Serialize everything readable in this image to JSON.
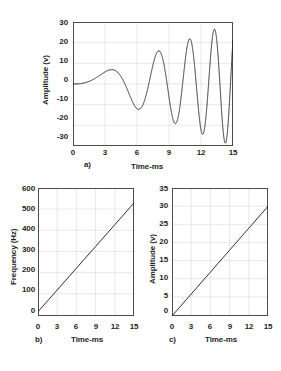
{
  "figure": {
    "background_color": "#ffffff",
    "line_color": "#1a1a1a",
    "frame_color": "#4d4d4d",
    "grid_color": "#d9d9d9"
  },
  "panels": {
    "a": {
      "label": "a)",
      "xlabel": "Time-ms",
      "ylabel": "Amplitude (v)",
      "xticks": [
        "0",
        "3",
        "6",
        "9",
        "12",
        "15"
      ],
      "yticks": [
        "-30",
        "-20",
        "-10",
        "0",
        "10",
        "20",
        "30"
      ]
    },
    "b": {
      "label": "b)",
      "xlabel": "Time-ms",
      "ylabel": "Frequency (Hz)",
      "xticks": [
        "0",
        "3",
        "6",
        "9",
        "12",
        "15"
      ],
      "yticks": [
        "0",
        "100",
        "200",
        "300",
        "400",
        "500",
        "600"
      ]
    },
    "c": {
      "label": "c)",
      "xlabel": "Time-ms",
      "ylabel": "Amplitude (v)",
      "xticks": [
        "0",
        "3",
        "6",
        "9",
        "12",
        "15"
      ],
      "yticks": [
        "0",
        "5",
        "10",
        "15",
        "20",
        "25",
        "30",
        "35"
      ]
    }
  },
  "chart_data": [
    {
      "id": "a",
      "type": "line",
      "title": "",
      "panel_label": "a)",
      "xlabel": "Time-ms",
      "ylabel": "Amplitude (v)",
      "xlim": [
        0,
        15
      ],
      "ylim": [
        -30,
        30
      ],
      "xticks": [
        0,
        3,
        6,
        9,
        12,
        15
      ],
      "yticks": [
        -30,
        -20,
        -10,
        0,
        10,
        20,
        30
      ],
      "grid": true,
      "legend": "none",
      "description": "Amplitude-modulated linear chirp: amplitude grows linearly 0 to 30 V while instantaneous frequency sweeps linearly 20 to 530 Hz over 15 ms.",
      "model": {
        "waveform": "A(t)*sin(2*pi*(f0*t + 0.5*k*t^2))",
        "amplitude_slope_v_per_ms": 2.0,
        "f0_hz": 20,
        "f1_hz": 530,
        "duration_ms": 15,
        "phase_offset_rad": 0
      },
      "envelope": {
        "t_ms": [
          0,
          3,
          6,
          9,
          12,
          15
        ],
        "upper_v": [
          0,
          6,
          12,
          18,
          24,
          30
        ],
        "lower_v": [
          0,
          -6,
          -12,
          -18,
          -24,
          -30
        ]
      },
      "peaks": {
        "t_ms": [
          2.6,
          5.6,
          7.6,
          9.2,
          10.6,
          11.8,
          13.0,
          14.1,
          15.0
        ],
        "value_v": [
          5,
          10.5,
          13.7,
          16.5,
          19.5,
          22,
          24.5,
          26.5,
          29.5
        ]
      },
      "troughs": {
        "t_ms": [
          4.4,
          6.7,
          8.5,
          9.9,
          11.2,
          12.4,
          13.6,
          14.6
        ],
        "value_v": [
          -9,
          -13,
          -16,
          -19,
          -21.5,
          -24,
          -26,
          -28.5
        ]
      }
    },
    {
      "id": "b",
      "type": "line",
      "title": "",
      "panel_label": "b)",
      "xlabel": "Time-ms",
      "ylabel": "Frequency (Hz)",
      "xlim": [
        0,
        15
      ],
      "ylim": [
        0,
        600
      ],
      "xticks": [
        0,
        3,
        6,
        9,
        12,
        15
      ],
      "yticks": [
        0,
        100,
        200,
        300,
        400,
        500,
        600
      ],
      "grid": true,
      "legend": "none",
      "x": [
        0,
        3,
        6,
        9,
        12,
        15
      ],
      "values": [
        20,
        122,
        224,
        326,
        428,
        530
      ]
    },
    {
      "id": "c",
      "type": "line",
      "title": "",
      "panel_label": "c)",
      "xlabel": "Time-ms",
      "ylabel": "Amplitude (v)",
      "xlim": [
        0,
        15
      ],
      "ylim": [
        0,
        35
      ],
      "xticks": [
        0,
        3,
        6,
        9,
        12,
        15
      ],
      "yticks": [
        0,
        5,
        10,
        15,
        20,
        25,
        30,
        35
      ],
      "grid": true,
      "legend": "none",
      "x": [
        0,
        3,
        6,
        9,
        12,
        15
      ],
      "values": [
        0,
        6,
        12,
        18,
        24,
        30
      ]
    }
  ]
}
